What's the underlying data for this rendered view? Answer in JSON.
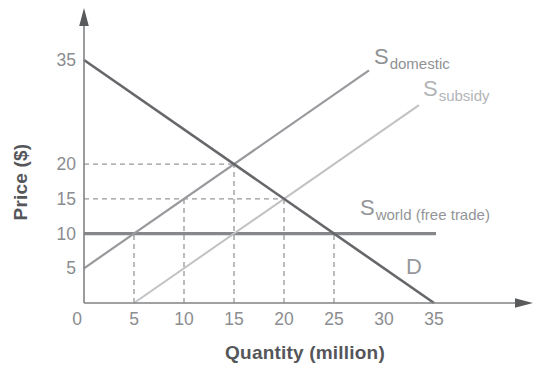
{
  "chart_data": {
    "type": "line",
    "title": "",
    "xlabel": "Quantity (million)",
    "ylabel": "Price ($)",
    "xlim": [
      0,
      38
    ],
    "ylim": [
      0,
      38
    ],
    "grid": false,
    "x_ticks": [
      0,
      5,
      10,
      15,
      20,
      25,
      30,
      35
    ],
    "y_ticks": [
      5,
      10,
      15,
      20,
      35
    ],
    "axis_color": "#808285",
    "tick_label_color": "#8b8d90",
    "series": [
      {
        "name": "demand",
        "label": {
          "main": "D",
          "sub": ""
        },
        "color": "#66676a",
        "points": [
          [
            0,
            35
          ],
          [
            35,
            0
          ]
        ]
      },
      {
        "name": "supply-domestic",
        "label": {
          "main": "S",
          "sub": "domestic"
        },
        "color": "#98999c",
        "points": [
          [
            0,
            5
          ],
          [
            28.5,
            33.5
          ]
        ]
      },
      {
        "name": "supply-subsidy",
        "label": {
          "main": "S",
          "sub": "subsidy"
        },
        "color": "#c0c2c4",
        "points": [
          [
            5,
            0
          ],
          [
            33.5,
            28.5
          ]
        ]
      },
      {
        "name": "supply-world",
        "label": {
          "main": "S",
          "sub": "world (free trade)"
        },
        "color": "#85878a",
        "points": [
          [
            0,
            10
          ],
          [
            35.2,
            10
          ]
        ]
      }
    ],
    "guides": {
      "color": "#96989b",
      "vertical": [
        {
          "x": 5,
          "y_top": 10
        },
        {
          "x": 10,
          "y_top": 15
        },
        {
          "x": 15,
          "y_top": 20
        },
        {
          "x": 20,
          "y_top": 15
        },
        {
          "x": 25,
          "y_top": 10
        }
      ],
      "horizontal": [
        {
          "y": 15,
          "x_right": 20
        },
        {
          "y": 20,
          "x_right": 15
        }
      ]
    },
    "key_points": [
      [
        5,
        10
      ],
      [
        10,
        15
      ],
      [
        15,
        20
      ],
      [
        20,
        15
      ],
      [
        25,
        10
      ]
    ]
  }
}
